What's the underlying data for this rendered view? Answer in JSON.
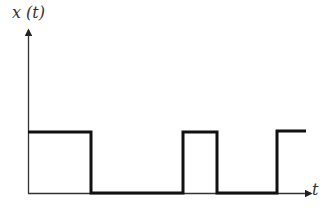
{
  "diagram": {
    "title": "",
    "y_axis_label": "x (t)",
    "x_axis_label": "t",
    "signal": {
      "type": "rectangular pulse train",
      "low_level": 0,
      "high_level": 1,
      "segments": [
        {
          "from": 0.0,
          "to": 0.23,
          "level": 1
        },
        {
          "from": 0.23,
          "to": 0.55,
          "level": 0
        },
        {
          "from": 0.55,
          "to": 0.67,
          "level": 1
        },
        {
          "from": 0.67,
          "to": 0.88,
          "level": 0
        },
        {
          "from": 0.88,
          "to": 1.0,
          "level": 1
        }
      ]
    },
    "colors": {
      "signal": "#111111",
      "axis": "#333333",
      "background": "#ffffff"
    }
  }
}
